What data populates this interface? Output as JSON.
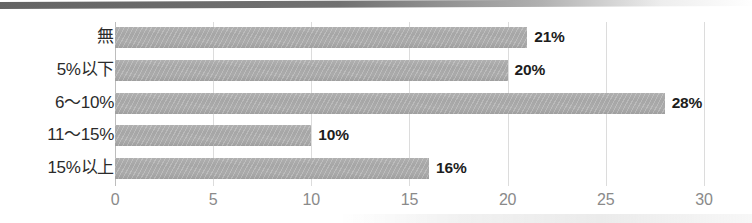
{
  "chart_data": {
    "type": "bar",
    "orientation": "horizontal",
    "title": "",
    "subtitle": "",
    "xlabel": "",
    "ylabel": "",
    "categories": [
      "無",
      "5%以下",
      "6〜10%",
      "11〜15%",
      "15%以上"
    ],
    "values": [
      21,
      20,
      28,
      10,
      16
    ],
    "data_labels": [
      "21%",
      "20%",
      "28%",
      "10%",
      "16%"
    ],
    "series": [
      {
        "name": "",
        "values": [
          21,
          20,
          28,
          10,
          16
        ]
      }
    ],
    "xlim": [
      0,
      30
    ],
    "x_ticks": [
      0,
      5,
      10,
      15,
      20,
      25,
      30
    ],
    "x_tick_labels": [
      "0",
      "5",
      "10",
      "15",
      "20",
      "25",
      "30"
    ],
    "grid": true,
    "grid_axis": "x",
    "legend": false,
    "legend_position": "none",
    "bar_color": "#a8a8a8",
    "grid_color": "#dcdcdc",
    "axis_color": "#bdbdbd",
    "label_color": "#1d1d1d",
    "tick_label_color": "#8a8a8a",
    "category_label_color": "#2b2b2b"
  },
  "artifacts": {
    "top_rule_color": "#5c5c5c"
  }
}
